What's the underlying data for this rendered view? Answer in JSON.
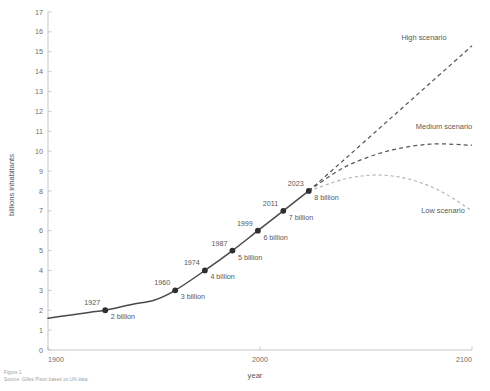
{
  "chart_data": {
    "type": "line",
    "title": "",
    "xlabel": "year",
    "ylabel": "billions inhabitants",
    "xlim": [
      1900,
      2100
    ],
    "ylim": [
      0,
      17
    ],
    "grid": false,
    "legend_position": "inline-right",
    "xticks": [
      "1900",
      "2000",
      "2100"
    ],
    "xtick_values": [
      1900,
      2000,
      2100
    ],
    "yticks": [
      "0",
      "1",
      "2",
      "3",
      "4",
      "5",
      "6",
      "7",
      "8",
      "9",
      "10",
      "11",
      "12",
      "13",
      "14",
      "15",
      "16",
      "17"
    ],
    "ytick_values": [
      0,
      1,
      2,
      3,
      4,
      5,
      6,
      7,
      8,
      9,
      10,
      11,
      12,
      13,
      14,
      15,
      16,
      17
    ],
    "series": [
      {
        "name": "Observed population",
        "style": "solid",
        "color": "#4a4a4c",
        "x": [
          1900,
          1910,
          1920,
          1927,
          1940,
          1950,
          1960,
          1974,
          1987,
          1999,
          2011,
          2023
        ],
        "values": [
          1.6,
          1.75,
          1.9,
          2.0,
          2.3,
          2.5,
          3.0,
          4.0,
          5.0,
          6.0,
          7.0,
          8.0
        ]
      },
      {
        "name": "High scenario",
        "style": "dashed",
        "color": "#58585a",
        "x": [
          2023,
          2040,
          2060,
          2080,
          2100
        ],
        "values": [
          8.0,
          9.6,
          11.5,
          13.4,
          15.3
        ]
      },
      {
        "name": "Medium scenario",
        "style": "dashed",
        "color": "#58585a",
        "x": [
          2023,
          2040,
          2060,
          2080,
          2100
        ],
        "values": [
          8.0,
          9.2,
          10.0,
          10.35,
          10.3
        ]
      },
      {
        "name": "Low scenario",
        "style": "dashed",
        "color": "#b0b1b3",
        "x": [
          2023,
          2040,
          2055,
          2070,
          2085,
          2100
        ],
        "values": [
          8.0,
          8.6,
          8.8,
          8.6,
          8.0,
          7.0
        ]
      }
    ],
    "annotations": [
      {
        "year": 1927,
        "value": 2.0,
        "year_label": "1927",
        "value_label": "2 billion"
      },
      {
        "year": 1960,
        "value": 3.0,
        "year_label": "1960",
        "value_label": "3 billion"
      },
      {
        "year": 1974,
        "value": 4.0,
        "year_label": "1974",
        "value_label": "4 billion"
      },
      {
        "year": 1987,
        "value": 5.0,
        "year_label": "1987",
        "value_label": "5 billion"
      },
      {
        "year": 1999,
        "value": 6.0,
        "year_label": "1999",
        "value_label": "6 billion"
      },
      {
        "year": 2011,
        "value": 7.0,
        "year_label": "2011",
        "value_label": "7 billion"
      },
      {
        "year": 2023,
        "value": 8.0,
        "year_label": "2023",
        "value_label": "8 billion"
      }
    ],
    "scenario_labels": [
      {
        "key": "high",
        "text": "High scenario"
      },
      {
        "key": "medium",
        "text": "Medium scenario"
      },
      {
        "key": "low",
        "text": "Low scenario"
      }
    ]
  },
  "axes": {
    "y_title": "billions inhabitants",
    "x_title": "year",
    "x_tick_1": "1900",
    "x_tick_2": "2000",
    "x_tick_3": "2100"
  },
  "caption": {
    "figure": "Figure 1",
    "source": "Source: Gilles Pison based on UN data."
  },
  "colors": {
    "line": "#4a4a4c",
    "forecast": "#58585a",
    "low_forecast": "#b0b1b3",
    "axis": "#bdbec0",
    "text": "#58585a",
    "tick_text": "#6d6e70",
    "caption_text": "#9c9ea1",
    "background": "#ffffff"
  }
}
